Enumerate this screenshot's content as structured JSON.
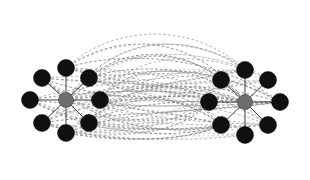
{
  "figure": {
    "width": 310,
    "height": 180,
    "background_color": "#ffffff"
  },
  "style": {
    "hub_color": "#6e6e6e",
    "leaf_color": "#101010",
    "spoke_color": "#2a2a2a",
    "bridge_color": "#9a9a9a",
    "bridge_color_faint": "#b4b4b4",
    "bridge_color_dark": "#7d7d7d",
    "hub_radius": 7.5,
    "leaf_radius": 8.5,
    "bridge_dash": "2.6 2.2"
  },
  "graph_data": {
    "type": "node-link-diagram",
    "directed": false,
    "cluster_count": 2,
    "node_count": 18,
    "hub_count": 2,
    "leaf_count": 16,
    "nodes": [
      {
        "id": "L-hub",
        "role": "hub",
        "cluster": "left",
        "x": 66,
        "y": 100,
        "r": 7.5,
        "color": "#6e6e6e"
      },
      {
        "id": "L-n",
        "role": "leaf",
        "cluster": "left",
        "x": 66,
        "y": 68,
        "r": 8.5,
        "color": "#101010"
      },
      {
        "id": "L-ne",
        "role": "leaf",
        "cluster": "left",
        "x": 89,
        "y": 78,
        "r": 8.5,
        "color": "#101010"
      },
      {
        "id": "L-e",
        "role": "leaf",
        "cluster": "left",
        "x": 100,
        "y": 100,
        "r": 8.5,
        "color": "#101010"
      },
      {
        "id": "L-se",
        "role": "leaf",
        "cluster": "left",
        "x": 89,
        "y": 123,
        "r": 8.5,
        "color": "#101010"
      },
      {
        "id": "L-s",
        "role": "leaf",
        "cluster": "left",
        "x": 66,
        "y": 133,
        "r": 8.5,
        "color": "#101010"
      },
      {
        "id": "L-sw",
        "role": "leaf",
        "cluster": "left",
        "x": 42,
        "y": 123,
        "r": 8.5,
        "color": "#101010"
      },
      {
        "id": "L-w",
        "role": "leaf",
        "cluster": "left",
        "x": 30,
        "y": 100,
        "r": 8.5,
        "color": "#101010"
      },
      {
        "id": "L-nw",
        "role": "leaf",
        "cluster": "left",
        "x": 42,
        "y": 78,
        "r": 8.5,
        "color": "#101010"
      },
      {
        "id": "R-hub",
        "role": "hub",
        "cluster": "right",
        "x": 245,
        "y": 102,
        "r": 7.5,
        "color": "#6e6e6e"
      },
      {
        "id": "R-n",
        "role": "leaf",
        "cluster": "right",
        "x": 245,
        "y": 70,
        "r": 8.5,
        "color": "#101010"
      },
      {
        "id": "R-ne",
        "role": "leaf",
        "cluster": "right",
        "x": 268,
        "y": 80,
        "r": 8.5,
        "color": "#101010"
      },
      {
        "id": "R-e",
        "role": "leaf",
        "cluster": "right",
        "x": 280,
        "y": 102,
        "r": 8.5,
        "color": "#101010"
      },
      {
        "id": "R-se",
        "role": "leaf",
        "cluster": "right",
        "x": 268,
        "y": 125,
        "r": 8.5,
        "color": "#101010"
      },
      {
        "id": "R-s",
        "role": "leaf",
        "cluster": "right",
        "x": 245,
        "y": 135,
        "r": 8.5,
        "color": "#101010"
      },
      {
        "id": "R-sw",
        "role": "leaf",
        "cluster": "right",
        "x": 221,
        "y": 125,
        "r": 8.5,
        "color": "#101010"
      },
      {
        "id": "R-w",
        "role": "leaf",
        "cluster": "right",
        "x": 209,
        "y": 102,
        "r": 8.5,
        "color": "#101010"
      },
      {
        "id": "R-nw",
        "role": "leaf",
        "cluster": "right",
        "x": 221,
        "y": 80,
        "r": 8.5,
        "color": "#101010"
      }
    ],
    "spokes": [
      {
        "source": "L-hub",
        "target": "L-n"
      },
      {
        "source": "L-hub",
        "target": "L-ne"
      },
      {
        "source": "L-hub",
        "target": "L-e"
      },
      {
        "source": "L-hub",
        "target": "L-se"
      },
      {
        "source": "L-hub",
        "target": "L-s"
      },
      {
        "source": "L-hub",
        "target": "L-sw"
      },
      {
        "source": "L-hub",
        "target": "L-w"
      },
      {
        "source": "L-hub",
        "target": "L-nw"
      },
      {
        "source": "R-hub",
        "target": "R-n"
      },
      {
        "source": "R-hub",
        "target": "R-ne"
      },
      {
        "source": "R-hub",
        "target": "R-e"
      },
      {
        "source": "R-hub",
        "target": "R-se"
      },
      {
        "source": "R-hub",
        "target": "R-s"
      },
      {
        "source": "R-hub",
        "target": "R-sw"
      },
      {
        "source": "R-hub",
        "target": "R-w"
      },
      {
        "source": "R-hub",
        "target": "R-nw"
      }
    ],
    "bridge_style": "curved-dashed",
    "bridge_description": "Dense bundle of gray dashed curves linking every left-cluster node to every right-cluster node, arcing above, below and straight through the middle.",
    "bridge_bundle_count": 64
  }
}
